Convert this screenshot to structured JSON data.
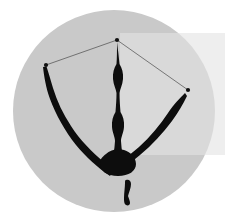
{
  "figure": {
    "background_color": "#ffffff",
    "field": {
      "name": "circular-field",
      "shape": "circle",
      "fill_color": "#c9c9c9",
      "center_x": 114,
      "center_y": 111,
      "radius": 101
    },
    "overlay_band": {
      "name": "light-overlay-band",
      "fill_color": "#e3e3e3",
      "opacity": 0.62,
      "x": 120,
      "y": 33,
      "width": 105,
      "height": 122
    },
    "specimen": {
      "name": "furcula-structure",
      "fill_color": "#0d0d0d",
      "description": "dark branching three-armed structure"
    },
    "fragment": {
      "name": "detached-fragment",
      "fill_color": "#0d0d0d",
      "description": "small detached hook-shaped fragment below the junction"
    },
    "landmarks": [
      {
        "id": "L1",
        "label": "apex",
        "x": 117,
        "y": 40,
        "color": "#111111"
      },
      {
        "id": "L2",
        "label": "left-tip",
        "x": 46,
        "y": 65,
        "color": "#111111"
      },
      {
        "id": "L3",
        "label": "right-tip",
        "x": 188,
        "y": 90,
        "color": "#111111"
      }
    ],
    "landmark_links": [
      {
        "from": "L2",
        "to": "L1",
        "color": "#4a4a4a",
        "width": 0.7
      },
      {
        "from": "L1",
        "to": "L3",
        "color": "#4a4a4a",
        "width": 0.7
      }
    ],
    "landmark_marker_size": 2.1,
    "paths": {
      "left_arm": "M46.5,66.5 C49,74 50.5,80 53,88 C57,101 63,114 71,126 C80,140 92,152 104,162 L114,170 L110,176 C98,168 86,157 76,145 C65,131 56,115 50,99 C46,88 44,76 43,67 Z",
      "center_stem": "M117,42 C118,50 119,58 119.5,64 C122,68 123.5,73 123,79 C122.5,85 120,89 119.5,93 C119.5,99 120,106 120.5,112 C123,116 124.5,121 124,127 C123.5,133 121,137 121,141 C121.5,150 123,158 125,166 L118,174 L111,166 C113,158 114.5,150 115,141 C115,137 112.5,133 112,127 C111.5,121 113,116 115.5,112 C116,106 116.5,99 116.5,93 C116,89 113.5,85 113,79 C112.5,73 114,68 116.5,64 C117,58 117,50 117,42 Z",
      "right_arm": "M187,96 C183,104 178,113 172,121 C163,133 152,145 140,155 C133,161 126,166 120,170 L114,172 L117,164 C124,159 132,153 139,147 C150,137 160,125 168,113 C174,104 180,98 185,93 Z",
      "junction_blob": "M106,154 C110,150 118,148 124,150 C131,152 136,158 136,164 C136,171 129,176 118,176 C107,176 100,171 100,164 C100,159 102,157 106,154 Z",
      "fragment": "M126,180 C129,179 131,181 131,184 C131,188 129,192 128,196 C129,199 130,201 130,203 C130,205 128,206 126,205 C124,204 124,201 124,198 C124,193 125,187 125,183 C125,181 125,180 126,180 Z"
    }
  }
}
